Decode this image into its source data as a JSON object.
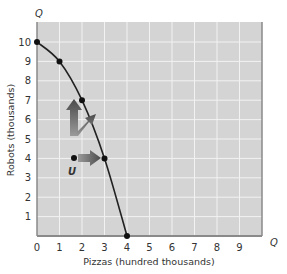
{
  "chart_data": {
    "type": "line",
    "title": "",
    "xlabel": "Pizzas (hundred thousands)",
    "ylabel": "Robots (thousands)",
    "x_axis_end_label": "Q",
    "y_axis_end_label": "Q",
    "xlim": [
      0,
      10
    ],
    "ylim": [
      0,
      11
    ],
    "x_ticks": [
      "0",
      "1",
      "2",
      "3",
      "4",
      "5",
      "6",
      "7",
      "8",
      "9"
    ],
    "y_ticks": [
      "1",
      "2",
      "3",
      "4",
      "5",
      "6",
      "7",
      "8",
      "9",
      "10"
    ],
    "grid": true,
    "series": [
      {
        "name": "Production possibilities frontier",
        "x": [
          0,
          1,
          2,
          3,
          4
        ],
        "y": [
          10,
          9,
          7,
          4,
          0
        ],
        "color": "#222222"
      }
    ],
    "annotations": [
      {
        "label": "U",
        "x": 1.5,
        "y": 4,
        "type": "point"
      },
      {
        "type": "arrow",
        "from": [
          1.5,
          4
        ],
        "to": [
          1.5,
          7.2
        ],
        "direction": "up"
      },
      {
        "type": "arrow",
        "from": [
          1.5,
          4
        ],
        "to": [
          2.3,
          5.0
        ],
        "direction": "up-right"
      },
      {
        "type": "arrow",
        "from": [
          1.5,
          4
        ],
        "to": [
          2.6,
          4
        ],
        "direction": "right"
      }
    ]
  },
  "colors": {
    "plot_bg": "#d4d4d4",
    "grid": "#f2f2f2",
    "frame": "#8a8a8a",
    "curve": "#222222",
    "arrow": "#6e6e6e"
  }
}
